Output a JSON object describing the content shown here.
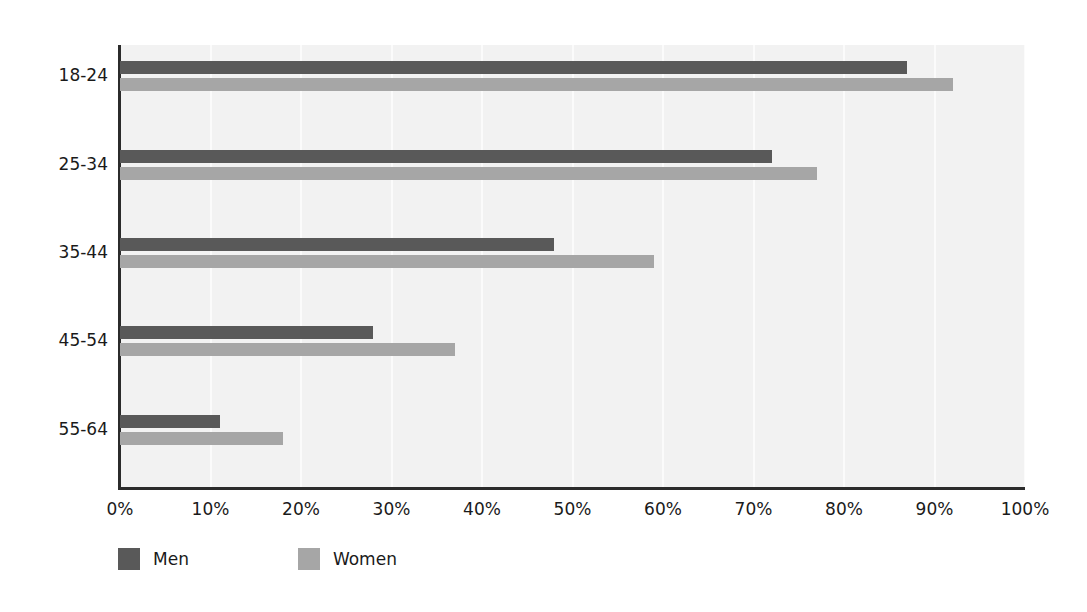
{
  "chart_data": {
    "type": "bar",
    "orientation": "horizontal",
    "title": "",
    "subtitle": "",
    "xlabel": "",
    "ylabel": "",
    "categories": [
      "18-24",
      "25-34",
      "35-44",
      "45-54",
      "55-64"
    ],
    "series": [
      {
        "name": "Men",
        "color": "#595959",
        "values": [
          87,
          72,
          48,
          28,
          11
        ]
      },
      {
        "name": "Women",
        "color": "#a6a6a6",
        "values": [
          92,
          77,
          59,
          37,
          18
        ]
      }
    ],
    "xlim": [
      0,
      100
    ],
    "xticks": [
      0,
      10,
      20,
      30,
      40,
      50,
      60,
      70,
      80,
      90,
      100
    ],
    "xtick_labels": [
      "0%",
      "10%",
      "20%",
      "30%",
      "40%",
      "50%",
      "60%",
      "70%",
      "80%",
      "90%",
      "100%"
    ],
    "grid": "vertical",
    "grid_color": "#fbfbfb",
    "plot_background": "#f2f2f2",
    "axis_color": "#2b2b2b",
    "legend_position": "bottom-left",
    "legend": [
      "Men",
      "Women"
    ]
  },
  "colors": {
    "men": "#595959",
    "women": "#a6a6a6",
    "plot_bg": "#f2f2f2",
    "axis": "#2b2b2b",
    "text": "#1a1a1a",
    "grid": "#fbfbfb"
  }
}
